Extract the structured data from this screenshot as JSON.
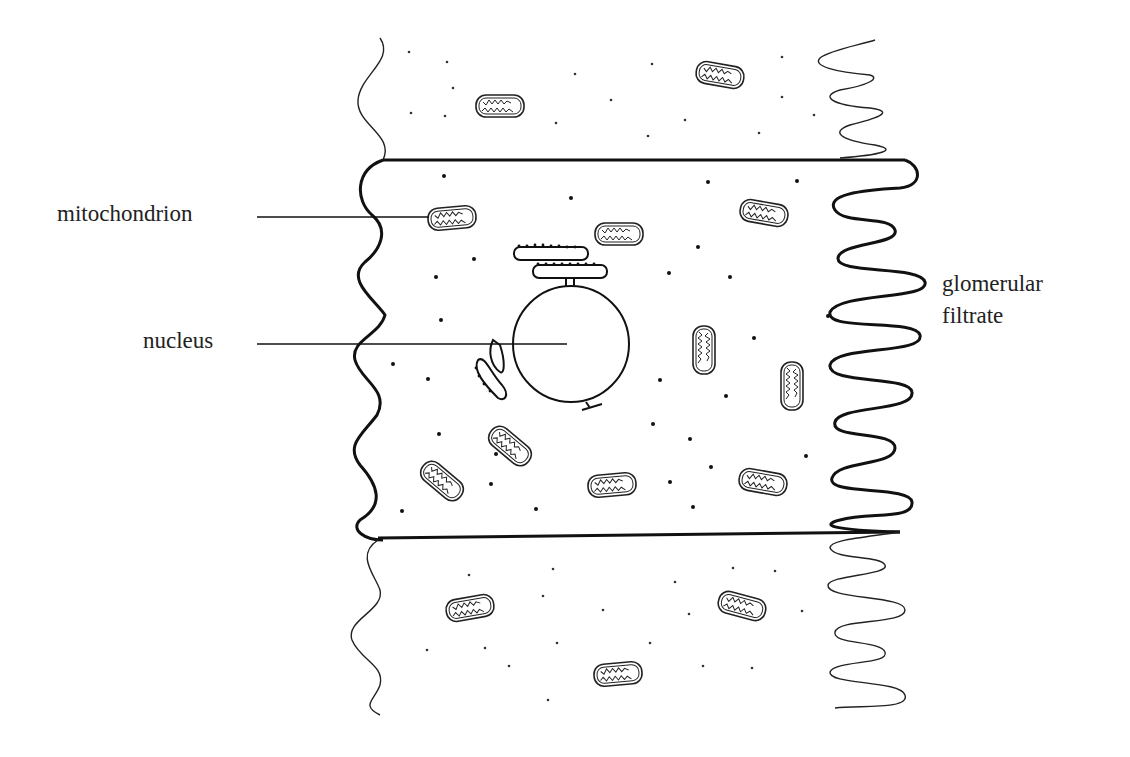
{
  "diagram": {
    "labels": {
      "mitochondrion": "mitochondrion",
      "nucleus": "nucleus",
      "glomerular_line1": "glomerular",
      "glomerular_line2": "filtrate"
    },
    "structures": [
      "cell membrane",
      "microvilli (brush border)",
      "nucleus",
      "rough endoplasmic reticulum",
      "mitochondria",
      "ribosomes",
      "neighbouring cells"
    ],
    "colors": {
      "ink": "#1a1a1a",
      "background": "#ffffff"
    }
  }
}
